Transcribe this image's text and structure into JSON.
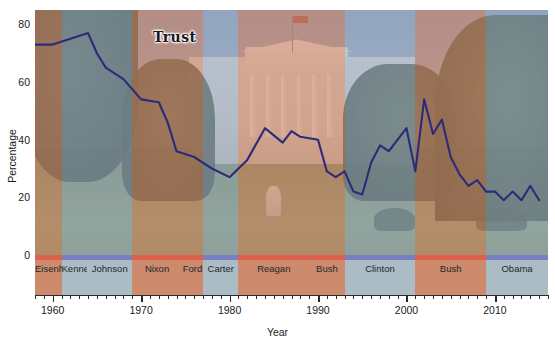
{
  "chart_data": {
    "type": "line",
    "title": "Trust",
    "series_label": "Trust",
    "xlabel": "Year",
    "ylabel": "Percentage",
    "xlim": [
      1958,
      2016
    ],
    "ylim": [
      0,
      85
    ],
    "yticks": [
      0,
      20,
      40,
      60,
      80
    ],
    "xticks": [
      1960,
      1970,
      1980,
      1990,
      2000,
      2010
    ],
    "grid": false,
    "legend_position": "inline-annotation",
    "line_color": "#2b2b7a",
    "republican_color": "#c66a46",
    "democrat_color": "#7896be",
    "x": [
      1958,
      1960,
      1962,
      1964,
      1965,
      1966,
      1968,
      1970,
      1972,
      1973,
      1974,
      1976,
      1978,
      1980,
      1982,
      1984,
      1986,
      1987,
      1988,
      1990,
      1991,
      1992,
      1993,
      1994,
      1995,
      1996,
      1997,
      1998,
      1999,
      2000,
      2001,
      2002,
      2003,
      2004,
      2005,
      2006,
      2007,
      2008,
      2009,
      2010,
      2011,
      2012,
      2013,
      2014,
      2015
    ],
    "y": [
      73,
      73,
      75,
      77,
      70,
      65,
      61,
      54,
      53,
      46,
      36,
      34,
      30,
      27,
      33,
      44,
      39,
      43,
      41,
      40,
      29,
      27,
      29,
      22,
      21,
      32,
      38,
      36,
      40,
      44,
      29,
      54,
      42,
      47,
      34,
      28,
      24,
      26,
      22,
      22,
      19,
      22,
      19,
      24,
      19
    ],
    "annotations": [
      {
        "label": "Trust",
        "x": 1965,
        "y": 79
      }
    ]
  },
  "presidents": [
    {
      "name": "Eisenhower",
      "party": "rep",
      "start": 1958,
      "end": 1961
    },
    {
      "name": "Kennedy",
      "party": "dem",
      "start": 1961,
      "end": 1963.9
    },
    {
      "name": "Johnson",
      "party": "dem",
      "start": 1963.9,
      "end": 1969
    },
    {
      "name": "Nixon",
      "party": "rep",
      "start": 1969,
      "end": 1974.6
    },
    {
      "name": "Ford",
      "party": "rep",
      "start": 1974.6,
      "end": 1977
    },
    {
      "name": "Carter",
      "party": "dem",
      "start": 1977,
      "end": 1981
    },
    {
      "name": "Reagan",
      "party": "rep",
      "start": 1981,
      "end": 1989
    },
    {
      "name": "Bush",
      "party": "rep",
      "start": 1989,
      "end": 1993
    },
    {
      "name": "Clinton",
      "party": "dem",
      "start": 1993,
      "end": 2001
    },
    {
      "name": "Bush",
      "party": "rep",
      "start": 2001,
      "end": 2009
    },
    {
      "name": "Obama",
      "party": "dem",
      "start": 2009,
      "end": 2016
    }
  ],
  "axis": {
    "y_labels": [
      "80",
      "60",
      "40",
      "20",
      "0"
    ],
    "y_values": [
      80,
      60,
      40,
      20,
      0
    ],
    "x_labels": [
      "1960",
      "1970",
      "1980",
      "1990",
      "2000",
      "2010"
    ],
    "y_title": "Percentage",
    "x_title": "Year"
  }
}
